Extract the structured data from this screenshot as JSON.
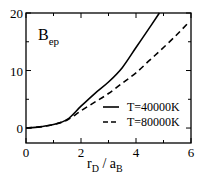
{
  "chart_data": {
    "type": "line",
    "title": "",
    "annotation": {
      "main": "B",
      "sub": "ep"
    },
    "xlabel": {
      "r": "r",
      "r_sub": "D",
      "slash": " / ",
      "a": "a",
      "a_sub": "B"
    },
    "ylabel": "",
    "xlim": [
      0,
      6
    ],
    "ylim": [
      -2.6,
      20
    ],
    "x_ticks": [
      0,
      2,
      4,
      6
    ],
    "x_tick_labels": [
      "0",
      "2",
      "4",
      "6"
    ],
    "x_minor_ticks": [
      1,
      3,
      5
    ],
    "y_ticks": [
      0,
      10,
      20
    ],
    "y_tick_labels": [
      "0",
      "10",
      "20"
    ],
    "y_minor_ticks": [
      5,
      15
    ],
    "grid": false,
    "legend_position": "lower right",
    "series": [
      {
        "name": "T=40000K",
        "style": "solid",
        "x": [
          0,
          0.5,
          1.0,
          1.5,
          2.0,
          2.5,
          3.0,
          3.5,
          4.0,
          4.5,
          4.85
        ],
        "y": [
          0,
          0.2,
          0.6,
          1.5,
          3.8,
          6.0,
          8.0,
          10.5,
          14.0,
          17.5,
          20.0
        ]
      },
      {
        "name": "T=80000K",
        "style": "dashed",
        "x": [
          0,
          0.5,
          1.0,
          1.5,
          2.0,
          2.5,
          3.0,
          3.5,
          4.0,
          4.5,
          5.0,
          5.5,
          5.9
        ],
        "y": [
          0,
          0.2,
          0.6,
          1.4,
          3.0,
          4.5,
          6.0,
          7.8,
          9.6,
          11.8,
          14.0,
          16.3,
          18.3
        ]
      }
    ]
  }
}
